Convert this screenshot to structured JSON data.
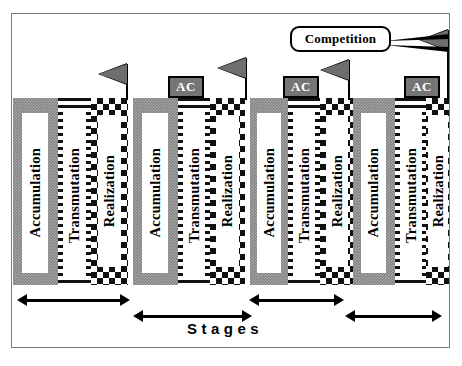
{
  "diagram": {
    "band": {
      "phases": [
        {
          "label": "Accumulation",
          "pattern": "stipple-grey",
          "left": 0,
          "width": 45
        },
        {
          "label": "Transmutation",
          "pattern": "horizontal-stripes",
          "left": 45,
          "width": 33
        },
        {
          "label": "Realization",
          "pattern": "checkerboard",
          "left": 78,
          "width": 37
        },
        {
          "label": "Accumulation",
          "pattern": "stipple-grey",
          "left": 120,
          "width": 45
        },
        {
          "label": "Transmutation",
          "pattern": "horizontal-stripes",
          "left": 165,
          "width": 32
        },
        {
          "label": "Realization",
          "pattern": "checkerboard",
          "left": 197,
          "width": 35
        },
        {
          "label": "Accumulation",
          "pattern": "stipple-grey",
          "left": 237,
          "width": 38
        },
        {
          "label": "Transmutation",
          "pattern": "horizontal-stripes",
          "left": 275,
          "width": 32
        },
        {
          "label": "Realization",
          "pattern": "checkerboard",
          "left": 307,
          "width": 33
        },
        {
          "label": "Accumulation",
          "pattern": "stipple-grey",
          "left": 340,
          "width": 42
        },
        {
          "label": "Transmutation",
          "pattern": "horizontal-stripes",
          "left": 382,
          "width": 31
        },
        {
          "label": "Realization",
          "pattern": "checkerboard",
          "left": 413,
          "width": 23
        }
      ]
    },
    "flags": [
      {
        "name": "flag-1",
        "x": 126,
        "y": 64,
        "height": 36
      },
      {
        "name": "flag-2",
        "x": 245,
        "y": 58,
        "height": 42
      },
      {
        "name": "flag-3",
        "x": 348,
        "y": 60,
        "height": 40
      },
      {
        "name": "flag-4",
        "x": 447,
        "y": 30,
        "height": 70
      }
    ],
    "ac_boxes": [
      {
        "label": "AC",
        "x": 168,
        "y": 76,
        "width": 36,
        "height": 22
      },
      {
        "label": "AC",
        "x": 283,
        "y": 76,
        "width": 36,
        "height": 22
      },
      {
        "label": "AC",
        "x": 404,
        "y": 76,
        "width": 36,
        "height": 22
      }
    ],
    "callout": {
      "label": "Competition",
      "x": 290,
      "y": 26,
      "width": 101,
      "height": 26
    },
    "arrows": [
      {
        "name": "stage-arrow-1",
        "x": 17,
        "y": 294,
        "width": 113
      },
      {
        "name": "stage-arrow-2",
        "x": 133,
        "y": 310,
        "width": 119
      },
      {
        "name": "stage-arrow-3",
        "x": 249,
        "y": 294,
        "width": 95
      },
      {
        "name": "stage-arrow-4",
        "x": 345,
        "y": 310,
        "width": 97
      }
    ],
    "stages_label": {
      "text": "Stages",
      "x": 187,
      "y": 320
    },
    "colors": {
      "accumulation_fill": "#838383",
      "pattern_ink": "#111111",
      "ac_box_fill": "#757575",
      "flag_fill": "#6e6e6e",
      "frame_border": "#7c7c7c",
      "background": "#ffffff"
    }
  }
}
